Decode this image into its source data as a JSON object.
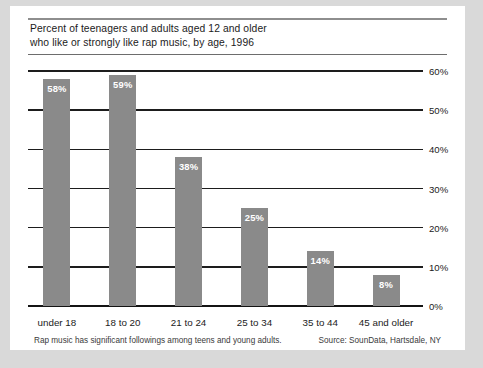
{
  "card": {
    "title_line1": "Percent of teenagers and adults aged 12 and older",
    "title_line2": "who like or strongly like rap music, by age, 1996",
    "footnote": "Rap music has significant followings among teens and young adults.",
    "source": "Source: SounData, Hartsdale, NY"
  },
  "colors": {
    "bar_fill": "#8a8a8a",
    "axis": "#1d1d1d",
    "page_background": "#d9d9d9",
    "card_background": "#ffffff",
    "text": "#1b1b1b",
    "value_label": "#ffffff"
  },
  "chart_data": {
    "type": "bar",
    "title": "Percent of teenagers and adults aged 12 and older who like or strongly like rap music, by age, 1996",
    "xlabel": "",
    "ylabel": "",
    "categories": [
      "under 18",
      "18 to 20",
      "21 to 24",
      "25 to 34",
      "35 to 44",
      "45 and older"
    ],
    "values": [
      58,
      59,
      38,
      25,
      14,
      8
    ],
    "data_labels": [
      "58%",
      "59%",
      "38%",
      "25%",
      "14%",
      "8%"
    ],
    "ylim": [
      0,
      60
    ],
    "ytick_values": [
      0,
      10,
      20,
      30,
      40,
      50,
      60
    ],
    "ytick_labels": [
      "0%",
      "10%",
      "20%",
      "30%",
      "40%",
      "50%",
      "60%"
    ],
    "grid": true,
    "grid_axis": "y",
    "legend": false,
    "legend_position": "none",
    "value_label_position": "inside-top",
    "ytick_label_position": "right"
  }
}
